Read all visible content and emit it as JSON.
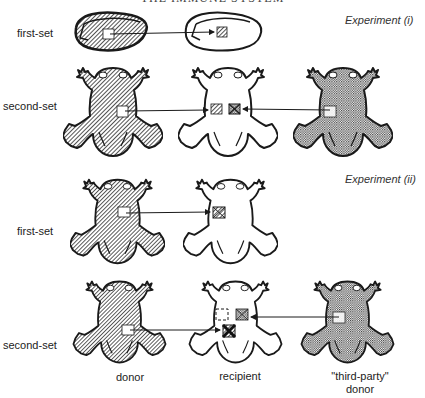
{
  "header": {
    "title": "THE IMMUNE SYSTEM"
  },
  "experiments": [
    {
      "label": "Experiment (i)",
      "rows": [
        {
          "label": "first-set",
          "subject": "kidney",
          "donor": "hatched",
          "recipient": "outline",
          "graft_result": "accepted-hatched"
        },
        {
          "label": "second-set",
          "subject": "frog",
          "donor": "hatched",
          "recipient": "outline",
          "third_party": "dotted",
          "grafts": [
            "hatched",
            "rejected-dotted"
          ]
        }
      ]
    },
    {
      "label": "Experiment (ii)",
      "rows": [
        {
          "label": "first-set",
          "subject": "frog",
          "donor": "hatched",
          "recipient": "outline",
          "graft_result": "rejected-hatched"
        },
        {
          "label": "second-set",
          "subject": "frog",
          "donor": "hatched",
          "recipient": "outline",
          "third_party": "dotted",
          "grafts": [
            "empty-dashed",
            "rejected-dotted",
            "strongly-rejected-hatched"
          ]
        }
      ]
    }
  ],
  "captions": {
    "donor": "donor",
    "recipient": "recipient",
    "third_party_line1": "\"third-party\"",
    "third_party_line2": "donor"
  },
  "colors": {
    "ink": "#1a1a1a",
    "paper": "#ffffff"
  }
}
